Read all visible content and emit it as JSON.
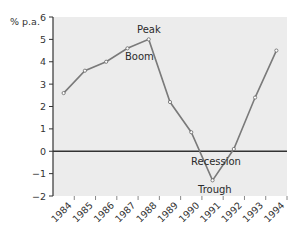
{
  "chart_data": {
    "type": "line",
    "title": "",
    "xlabel": "",
    "ylabel": "% p.a.",
    "x": [
      "1984",
      "1985",
      "1986",
      "1987",
      "1988",
      "1989",
      "1990",
      "1991",
      "1992",
      "1993",
      "1994"
    ],
    "series": [
      {
        "name": "Economic growth",
        "values": [
          2.6,
          3.6,
          4.0,
          4.6,
          5.0,
          2.2,
          0.85,
          -1.3,
          0.1,
          2.4,
          4.5
        ]
      }
    ],
    "ylim": [
      -2,
      6
    ],
    "yticks": [
      -2,
      -1,
      0,
      1,
      2,
      3,
      4,
      5,
      6
    ],
    "ytick_labels": [
      "−2",
      "−1",
      "0",
      "1",
      "2",
      "3",
      "4",
      "5",
      "6"
    ],
    "grid": false,
    "legend": null,
    "annotations": [
      {
        "text": "Peak",
        "x": "1988",
        "position": "above"
      },
      {
        "text": "Boom",
        "x": "1988",
        "position": "below-left"
      },
      {
        "text": "Recession",
        "x": "1991",
        "position": "above-point-below-zero"
      },
      {
        "text": "Trough",
        "x": "1991",
        "position": "below"
      }
    ],
    "colors": {
      "line": "#7a7a7a",
      "plot_background": "#ececec",
      "zero_line": "#333333",
      "axis": "#333333"
    }
  },
  "labels": {
    "ylabel": "% p.a.",
    "peak": "Peak",
    "boom": "Boom",
    "recession": "Recession",
    "trough": "Trough"
  }
}
